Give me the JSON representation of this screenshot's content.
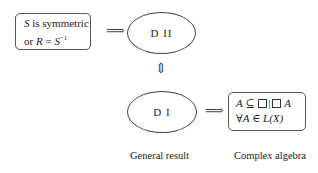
{
  "nodes": {
    "condition": {
      "line1_var": "S",
      "line1_text": " is symmetric",
      "line2_prefix": "or ",
      "line2_var": "R",
      "line2_eq": " = ",
      "line2_var2": "S",
      "line2_sup": "−1"
    },
    "d2": {
      "label": "D II"
    },
    "d1": {
      "label": "D I"
    },
    "algebra": {
      "line1_var": "A",
      "line1_rel": " ⊆ ",
      "line1_sep": "|",
      "line1_end": " A",
      "line2_prefix": "∀",
      "line2_var": "A",
      "line2_rel": " ∈ ",
      "line2_end": "L(X)"
    }
  },
  "arrows": {
    "implies_right": "⟹",
    "double_vertical": "⇕"
  },
  "captions": {
    "general": "General result",
    "complex": "Complex algebra"
  }
}
